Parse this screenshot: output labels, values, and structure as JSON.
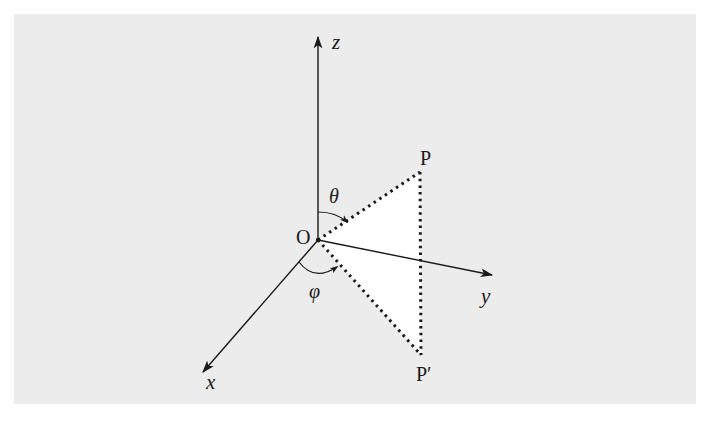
{
  "diagram": {
    "type": "3d-spherical-coordinates",
    "colors": {
      "panel_background": "#ececec",
      "page_background": "#ffffff",
      "stroke": "#1a1a1a",
      "triangle_fill": "#ffffff"
    },
    "origin": {
      "label": "O",
      "x": 318,
      "y": 240
    },
    "axes": [
      {
        "name": "z",
        "label": "z",
        "tip": {
          "x": 318,
          "y": 37
        }
      },
      {
        "name": "y",
        "label": "y",
        "tip": {
          "x": 492,
          "y": 275
        }
      },
      {
        "name": "x",
        "label": "x",
        "tip": {
          "x": 203,
          "y": 372
        }
      }
    ],
    "points": [
      {
        "name": "P",
        "label": "P",
        "x": 420,
        "y": 172
      },
      {
        "name": "P-prime",
        "label": "P′",
        "x": 421,
        "y": 355
      }
    ],
    "angles": [
      {
        "name": "theta",
        "label": "θ",
        "between": [
          "z-axis",
          "OP"
        ]
      },
      {
        "name": "phi",
        "label": "φ",
        "between": [
          "x-axis",
          "OP′"
        ]
      }
    ],
    "edges": [
      {
        "from": "O",
        "to": "P",
        "style": "dotted"
      },
      {
        "from": "P",
        "to": "P′",
        "style": "dotted"
      },
      {
        "from": "O",
        "to": "P′",
        "style": "dotted"
      }
    ]
  }
}
